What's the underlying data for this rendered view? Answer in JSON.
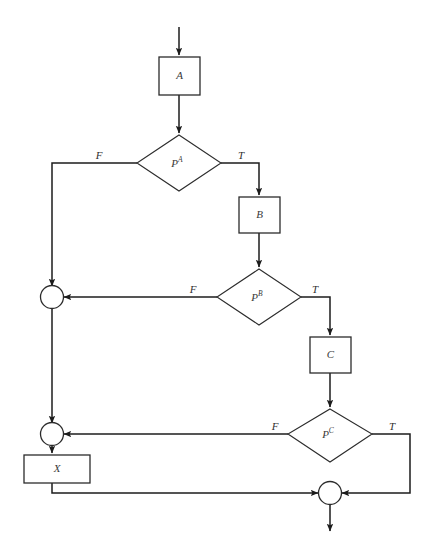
{
  "diagram": {
    "type": "flowchart",
    "background_color": "#ffffff",
    "line_color": "#1c1c1c",
    "node_fill": "#ffffff"
  },
  "nodes": {
    "process_a": {
      "label": "A",
      "shape": "rectangle"
    },
    "process_b": {
      "label": "B",
      "shape": "rectangle"
    },
    "process_c": {
      "label": "C",
      "shape": "rectangle"
    },
    "process_x": {
      "label": "X",
      "shape": "rectangle"
    },
    "decision_pa": {
      "label": "P",
      "superscript": "A",
      "shape": "diamond"
    },
    "decision_pb": {
      "label": "P",
      "superscript": "B",
      "shape": "diamond"
    },
    "decision_pc": {
      "label": "P",
      "superscript": "C",
      "shape": "diamond"
    },
    "merge_1": {
      "label": "",
      "shape": "circle"
    },
    "merge_2": {
      "label": "",
      "shape": "circle"
    },
    "merge_3": {
      "label": "",
      "shape": "circle"
    }
  },
  "edge_labels": {
    "pa_false": "F",
    "pa_true": "T",
    "pb_false": "F",
    "pb_true": "T",
    "pc_false": "F",
    "pc_true": "T"
  }
}
